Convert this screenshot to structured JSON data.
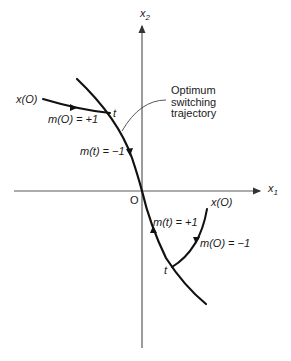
{
  "figure": {
    "axes": {
      "x_label": "x",
      "x_sub": "1",
      "y_label": "x",
      "y_sub": "2",
      "origin_label": "O"
    },
    "annotation": {
      "lines": [
        "Optimum",
        "switching",
        "trajectory"
      ]
    },
    "upper_left_trajectory": {
      "start_label": "x(O)",
      "control_label": "m(O) = +1",
      "switch_label": "t"
    },
    "switching_curve_upper": {
      "control_label": "m(t) = −1"
    },
    "lower_right_trajectory": {
      "start_label": "x(O)",
      "control_label": "m(O) = −1",
      "switch_label": "t"
    },
    "switching_curve_lower": {
      "control_label": "m(t) = +1"
    }
  }
}
